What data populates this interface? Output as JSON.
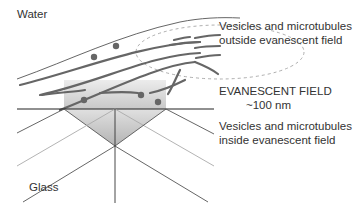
{
  "labels": {
    "water": "Water",
    "glass": "Glass",
    "outside_line1": "Vesicles and microtubules",
    "outside_line2": "outside evanescent field",
    "field_title": "EVANESCENT FIELD",
    "field_depth": "~100 nm",
    "inside_line1": "Vesicles and microtubules",
    "inside_line2": "inside evanescent field"
  },
  "colors": {
    "microtubule": "#666666",
    "vesicle": "#666666",
    "interface": "#222222",
    "beam_light": "#aaaaaa",
    "beam_dark": "#555555",
    "evanescent_fill": "#d0d0d0",
    "dashed": "#999999"
  }
}
